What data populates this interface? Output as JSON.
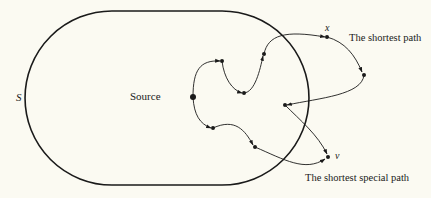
{
  "diagram": {
    "region_label": "S",
    "source_label": "Source",
    "x_label": "x",
    "v_label": "v",
    "shortest_path_label": "The shortest path",
    "shortest_special_path_label": "The shortest special path",
    "colors": {
      "background": "#fbfaf2",
      "stroke": "#1a1a1a"
    },
    "region": {
      "shape": "stadium",
      "left_x": 25,
      "right_x": 309,
      "top_y": 11,
      "bottom_y": 185
    },
    "nodes": [
      {
        "id": "source",
        "x": 193,
        "y": 97
      },
      {
        "id": "a",
        "x": 222,
        "y": 61
      },
      {
        "id": "b",
        "x": 244,
        "y": 93
      },
      {
        "id": "c",
        "x": 264,
        "y": 54
      },
      {
        "id": "x",
        "x": 327,
        "y": 37
      },
      {
        "id": "d",
        "x": 364,
        "y": 75
      },
      {
        "id": "e",
        "x": 285,
        "y": 105
      },
      {
        "id": "v",
        "x": 328,
        "y": 157
      },
      {
        "id": "f",
        "x": 213,
        "y": 128
      },
      {
        "id": "g",
        "x": 255,
        "y": 147
      }
    ],
    "paths": [
      {
        "name": "shortest-path",
        "sequence": [
          "source",
          "a",
          "b",
          "c",
          "x",
          "d",
          "e",
          "v"
        ]
      },
      {
        "name": "shortest-special-path",
        "sequence": [
          "source",
          "f",
          "g",
          "v"
        ]
      }
    ]
  }
}
